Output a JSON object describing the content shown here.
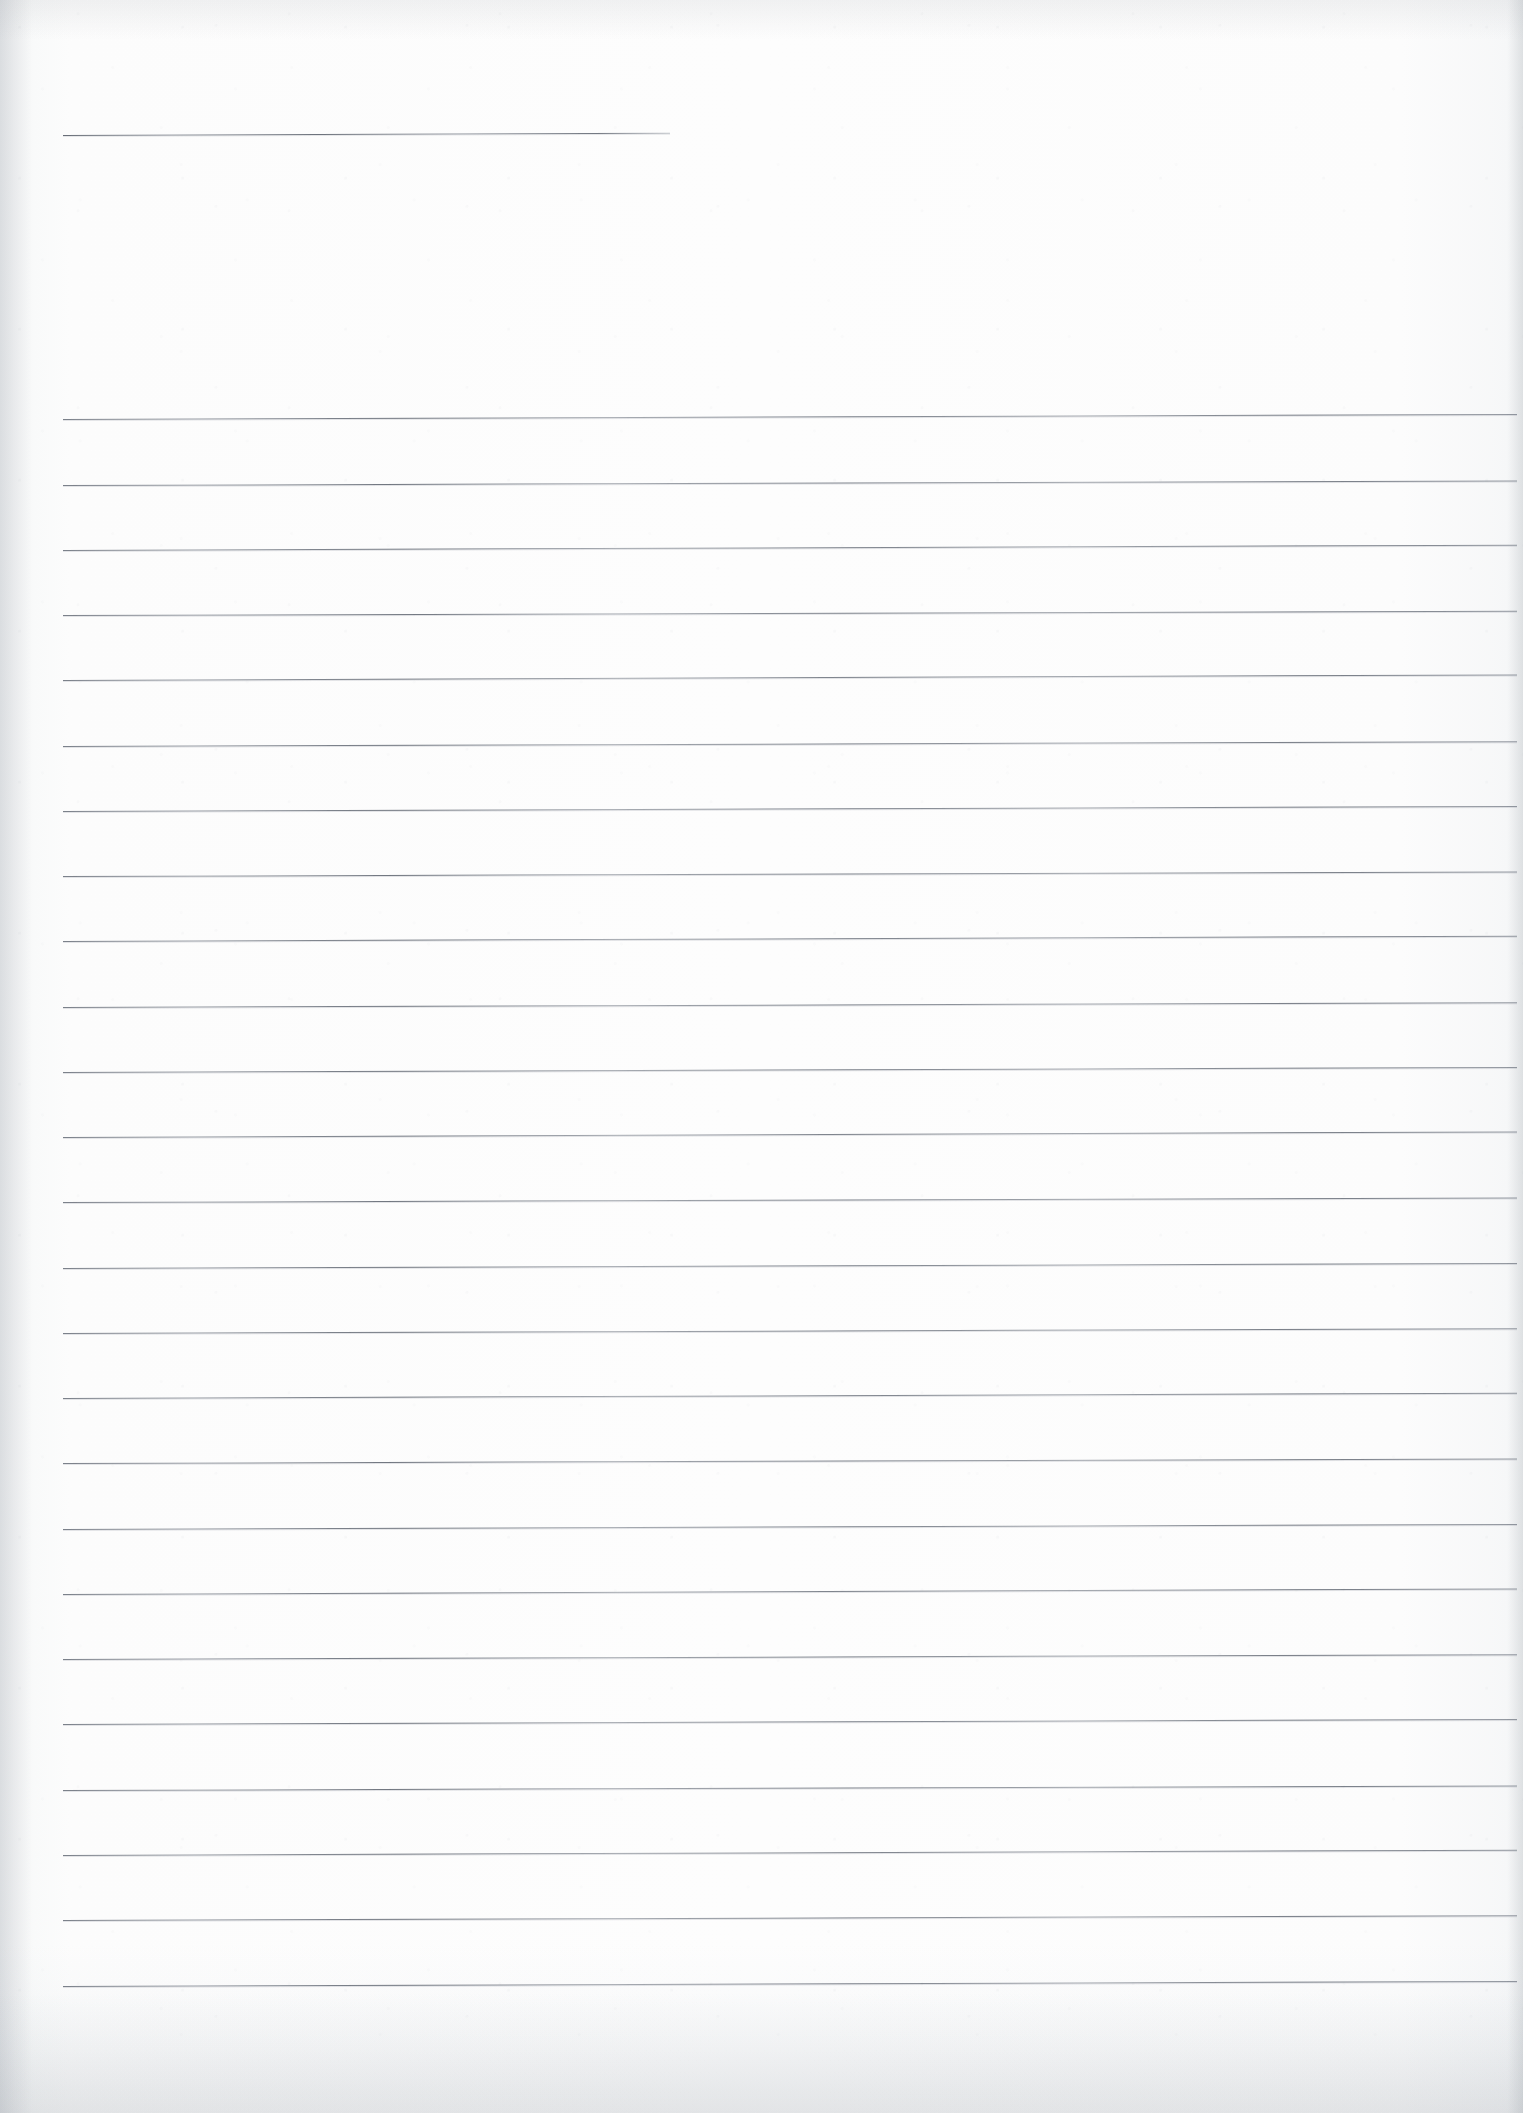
{
  "document": {
    "type": "scanned-ruled-notebook-paper",
    "title": "",
    "page_width": 1523,
    "page_height": 2113,
    "orientation": "portrait",
    "has_text_content": false,
    "handwriting": "",
    "typed_text": "",
    "page_number": ""
  },
  "colors": {
    "paper": "#fdfdfd",
    "paper_shadow": "#eceef0",
    "rule_line": "#6f7580",
    "rule_line_light": "#969ca5",
    "edge_shade": "#969ca4"
  },
  "header_rule": {
    "name": "title-rule",
    "x": 63,
    "y": 135,
    "width": 607,
    "slope_deg": -0.22,
    "thickness": 1
  },
  "ruled_area": {
    "left": 63,
    "right": 1517,
    "line_width": 1454,
    "first_line_y": 419,
    "line_spacing": 65.3,
    "line_count": 25,
    "thickness": 1
  },
  "rules": [
    {
      "index": 1,
      "y": 419,
      "slope_deg": -0.2
    },
    {
      "index": 2,
      "y": 485,
      "slope_deg": -0.18
    },
    {
      "index": 3,
      "y": 550,
      "slope_deg": -0.21
    },
    {
      "index": 4,
      "y": 615,
      "slope_deg": -0.17
    },
    {
      "index": 5,
      "y": 680,
      "slope_deg": -0.22
    },
    {
      "index": 6,
      "y": 746,
      "slope_deg": -0.19
    },
    {
      "index": 7,
      "y": 811,
      "slope_deg": -0.2
    },
    {
      "index": 8,
      "y": 876,
      "slope_deg": -0.18
    },
    {
      "index": 9,
      "y": 941,
      "slope_deg": -0.21
    },
    {
      "index": 10,
      "y": 1007,
      "slope_deg": -0.19
    },
    {
      "index": 11,
      "y": 1072,
      "slope_deg": -0.2
    },
    {
      "index": 12,
      "y": 1137,
      "slope_deg": -0.22
    },
    {
      "index": 13,
      "y": 1202,
      "slope_deg": -0.18
    },
    {
      "index": 14,
      "y": 1268,
      "slope_deg": -0.2
    },
    {
      "index": 15,
      "y": 1333,
      "slope_deg": -0.19
    },
    {
      "index": 16,
      "y": 1398,
      "slope_deg": -0.21
    },
    {
      "index": 17,
      "y": 1463,
      "slope_deg": -0.18
    },
    {
      "index": 18,
      "y": 1529,
      "slope_deg": -0.2
    },
    {
      "index": 19,
      "y": 1594,
      "slope_deg": -0.22
    },
    {
      "index": 20,
      "y": 1659,
      "slope_deg": -0.19
    },
    {
      "index": 21,
      "y": 1724,
      "slope_deg": -0.2
    },
    {
      "index": 22,
      "y": 1790,
      "slope_deg": -0.18
    },
    {
      "index": 23,
      "y": 1855,
      "slope_deg": -0.21
    },
    {
      "index": 24,
      "y": 1920,
      "slope_deg": -0.19
    },
    {
      "index": 25,
      "y": 1986,
      "slope_deg": -0.2
    }
  ]
}
